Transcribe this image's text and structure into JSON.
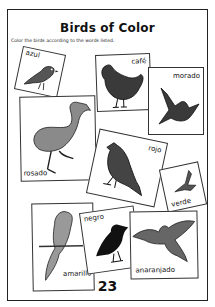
{
  "worksheet": {
    "title": "Birds of Color",
    "instructions": "Color the birds according to the words listed.",
    "page_number": "23",
    "cards": [
      {
        "label": "azul",
        "bird": "sparrow"
      },
      {
        "label": "café",
        "bird": "hen"
      },
      {
        "label": "morado",
        "bird": "swallow"
      },
      {
        "label": "rosado",
        "bird": "flamingo"
      },
      {
        "label": "rojo",
        "bird": "cardinal"
      },
      {
        "label": "verde",
        "bird": "hummingbird"
      },
      {
        "label": "amarillo",
        "bird": "parrot"
      },
      {
        "label": "negro",
        "bird": "crow"
      },
      {
        "label": "anaranjado",
        "bird": "flying-bird"
      }
    ]
  }
}
